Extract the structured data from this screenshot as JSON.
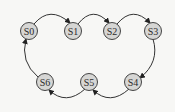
{
  "diagram": {
    "type": "state-transition",
    "colors": {
      "background": "#f7f7f5",
      "node_fill": "#d6d6d4",
      "stroke": "#333333"
    },
    "nodes": [
      {
        "id": "S0",
        "label": "S0",
        "x": 29,
        "y": 31
      },
      {
        "id": "S1",
        "label": "S1",
        "x": 73,
        "y": 31
      },
      {
        "id": "S2",
        "label": "S2",
        "x": 112,
        "y": 31
      },
      {
        "id": "S3",
        "label": "S3",
        "x": 153,
        "y": 31
      },
      {
        "id": "S4",
        "label": "S4",
        "x": 133,
        "y": 82
      },
      {
        "id": "S5",
        "label": "S5",
        "x": 89,
        "y": 82
      },
      {
        "id": "S6",
        "label": "S6",
        "x": 45,
        "y": 82
      }
    ],
    "edges": [
      {
        "from": "S0",
        "to": "S1"
      },
      {
        "from": "S1",
        "to": "S2"
      },
      {
        "from": "S2",
        "to": "S3"
      },
      {
        "from": "S3",
        "to": "S4"
      },
      {
        "from": "S4",
        "to": "S5"
      },
      {
        "from": "S5",
        "to": "S6"
      },
      {
        "from": "S6",
        "to": "S0"
      }
    ]
  }
}
